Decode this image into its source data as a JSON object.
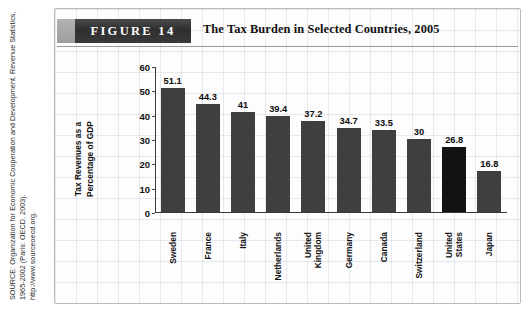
{
  "figure": {
    "label": "FIGURE 14",
    "title": "The Tax Burden in Selected Countries, 2005",
    "source": "SOURCE: Organization for Economic Cooperation and Development, Revenue Statistics, 1965-2002 (Paris: OECD, 2003).\nhttp://www.sourceoecd.org."
  },
  "colors": {
    "bar": "#3f3f3f",
    "bar_highlight": "#121212",
    "banner_dark": "#2f2f2f",
    "banner_light": "#a8a8a8",
    "grid": "#b5bac4"
  },
  "chart_data": {
    "type": "bar",
    "title": "The Tax Burden in Selected Countries, 2005",
    "xlabel": "",
    "ylabel": "Tax Revenues as a Percentage of GDP",
    "ylabel_lines": [
      "Tax Revenues as a",
      "Percentage of GDP"
    ],
    "ylim": [
      0,
      60
    ],
    "yticks": [
      0,
      10,
      20,
      30,
      40,
      50,
      60
    ],
    "ytick_labels": [
      "0",
      "10",
      "20",
      "30",
      "40",
      "50",
      "60"
    ],
    "grid": false,
    "legend": "none",
    "categories": [
      "Sweden",
      "France",
      "Italy",
      "Netherlands",
      "United Kingdom",
      "Germany",
      "Canada",
      "Switzerland",
      "United States",
      "Japan"
    ],
    "category_lines": [
      [
        "Sweden"
      ],
      [
        "France"
      ],
      [
        "Italy"
      ],
      [
        "Netherlands"
      ],
      [
        "United",
        "Kingdom"
      ],
      [
        "Germany"
      ],
      [
        "Canada"
      ],
      [
        "Switzerland"
      ],
      [
        "United",
        "States"
      ],
      [
        "Japan"
      ]
    ],
    "values": [
      51.1,
      44.3,
      41,
      39.4,
      37.2,
      34.7,
      33.5,
      30,
      26.8,
      16.8
    ],
    "value_labels": [
      "51.1",
      "44.3",
      "41",
      "39.4",
      "37.2",
      "34.7",
      "33.5",
      "30",
      "26.8",
      "16.8"
    ],
    "highlight_index": 8
  }
}
